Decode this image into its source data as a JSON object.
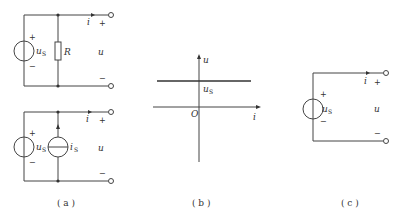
{
  "figure_a_top": {
    "source_label": "u",
    "source_sub": "S",
    "resistor_label": "R",
    "current_label": "i",
    "voltage_label": "u",
    "plus": "+",
    "minus": "−"
  },
  "figure_a_bottom": {
    "source_label": "u",
    "source_sub": "S",
    "current_source_label": "i",
    "current_source_sub": "S",
    "current_label": "i",
    "voltage_label": "u",
    "plus": "+",
    "minus": "−"
  },
  "figure_b": {
    "y_axis_label": "u",
    "x_axis_label": "i",
    "origin_label": "O",
    "level_label": "u",
    "level_sub": "S"
  },
  "figure_c": {
    "source_label": "u",
    "source_sub": "S",
    "current_label": "i",
    "voltage_label": "u",
    "plus": "+",
    "minus": "−"
  },
  "captions": {
    "a": "( a )",
    "b": "( b )",
    "c": "( c )"
  }
}
